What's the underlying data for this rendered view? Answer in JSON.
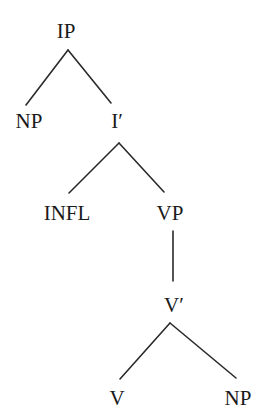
{
  "diagram": {
    "type": "syntax-tree",
    "nodes": {
      "ip": {
        "label": "IP",
        "x": 66,
        "y": 21
      },
      "np_subject": {
        "label": "NP",
        "x": 29,
        "y": 111
      },
      "i_bar": {
        "label": "I′",
        "x": 117,
        "y": 111
      },
      "infl": {
        "label": "INFL",
        "x": 67,
        "y": 203
      },
      "vp": {
        "label": "VP",
        "x": 170,
        "y": 203
      },
      "v_bar": {
        "label": "V′",
        "x": 174,
        "y": 295
      },
      "v": {
        "label": "V",
        "x": 117,
        "y": 388
      },
      "np_object": {
        "label": "NP",
        "x": 238,
        "y": 388
      }
    },
    "edges": [
      {
        "from": "IP",
        "to": "NP",
        "x1": 68,
        "y1": 50,
        "x2": 26,
        "y2": 105
      },
      {
        "from": "IP",
        "to": "I′",
        "x1": 68,
        "y1": 50,
        "x2": 111,
        "y2": 103
      },
      {
        "from": "I′",
        "to": "INFL",
        "x1": 119,
        "y1": 143,
        "x2": 69,
        "y2": 193
      },
      {
        "from": "I′",
        "to": "VP",
        "x1": 119,
        "y1": 143,
        "x2": 164,
        "y2": 192
      },
      {
        "from": "VP",
        "to": "V′",
        "x1": 173,
        "y1": 231,
        "x2": 173,
        "y2": 281
      },
      {
        "from": "V′",
        "to": "V",
        "x1": 170,
        "y1": 323,
        "x2": 120,
        "y2": 379
      },
      {
        "from": "V′",
        "to": "NP",
        "x1": 170,
        "y1": 323,
        "x2": 236,
        "y2": 378
      }
    ],
    "colors": {
      "background": "#ffffff",
      "text": "#1a1a1a",
      "line": "#2a2a2a"
    }
  }
}
